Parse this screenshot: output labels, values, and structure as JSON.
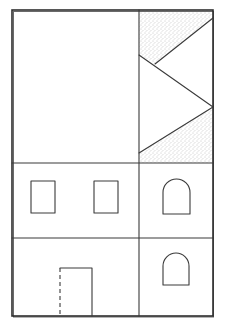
{
  "figure": {
    "type": "facade-line-drawing",
    "canvas": {
      "width": 225,
      "height": 327
    },
    "colors": {
      "background": "#ffffff",
      "line": "#3a3a3a",
      "stipple": "#8a8a8a"
    },
    "outline": {
      "x": 12,
      "y": 10,
      "width": 201,
      "height": 306
    },
    "dividers": {
      "vertical_x": 139,
      "horizontal_y": [
        163,
        238
      ]
    },
    "upper_right_panel": {
      "shaded_regions": [
        {
          "name": "top-shaded-triangle",
          "points": "139,10 213,10 213,18 155,64 139,55"
        },
        {
          "name": "bottom-shaded-triangle",
          "points": "139,153 213,107 213,163 139,163"
        }
      ],
      "lines": [
        {
          "name": "diagonal-top",
          "x1": 213,
          "y1": 18,
          "x2": 155,
          "y2": 64
        },
        {
          "name": "diagonal-middle-down",
          "x1": 139,
          "y1": 55,
          "x2": 213,
          "y2": 107
        },
        {
          "name": "diagonal-lower",
          "x1": 213,
          "y1": 107,
          "x2": 139,
          "y2": 153
        }
      ]
    },
    "windows": [
      {
        "name": "rect-window-left",
        "shape": "rect",
        "x": 31,
        "y": 181,
        "width": 24,
        "height": 32
      },
      {
        "name": "rect-window-center",
        "shape": "rect",
        "x": 94,
        "y": 181,
        "width": 24,
        "height": 32
      },
      {
        "name": "arched-window-upper",
        "shape": "arch",
        "x": 163,
        "y": 179,
        "width": 27,
        "height": 35
      },
      {
        "name": "arched-window-lower",
        "shape": "arch",
        "x": 163,
        "y": 253,
        "width": 26,
        "height": 32
      }
    ],
    "door": {
      "name": "door",
      "x": 60,
      "y": 268,
      "width": 32,
      "height": 48,
      "left_edge": "dashed"
    }
  }
}
